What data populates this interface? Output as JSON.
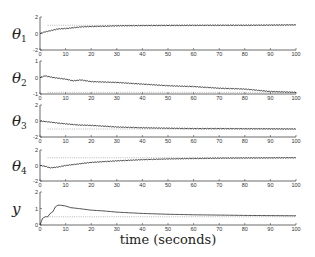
{
  "chart_data": {
    "type": "line",
    "xlabel": "time (seconds)",
    "xlim": [
      0,
      100
    ],
    "xticks": [
      0,
      10,
      20,
      30,
      40,
      50,
      60,
      70,
      80,
      90,
      100
    ],
    "grid": false,
    "legend": null,
    "panels": [
      {
        "ylabel": "θ",
        "ylabel_sub": "1",
        "ylim": [
          -2,
          2
        ],
        "yticks": [
          -2,
          0,
          2
        ],
        "reference": 1,
        "x": [
          0,
          2,
          5,
          7,
          10,
          13,
          16,
          20,
          25,
          30,
          40,
          50,
          60,
          70,
          80,
          90,
          100
        ],
        "y": [
          0,
          0.2,
          0.4,
          0.55,
          0.6,
          0.7,
          0.8,
          0.85,
          0.88,
          0.93,
          0.96,
          0.98,
          0.99,
          1.0,
          1.0,
          1.02,
          1.05
        ]
      },
      {
        "ylabel": "θ",
        "ylabel_sub": "2",
        "ylim": [
          -1,
          1
        ],
        "yticks": [
          -1,
          0,
          1
        ],
        "reference": -0.9,
        "x": [
          0,
          2,
          5,
          10,
          13,
          16,
          20,
          30,
          40,
          50,
          60,
          70,
          80,
          90,
          100
        ],
        "y": [
          0,
          0.1,
          0.0,
          -0.1,
          -0.2,
          -0.15,
          -0.25,
          -0.3,
          -0.4,
          -0.5,
          -0.55,
          -0.65,
          -0.7,
          -0.85,
          -0.9
        ]
      },
      {
        "ylabel": "θ",
        "ylabel_sub": "3",
        "ylim": [
          -2,
          2
        ],
        "yticks": [
          -2,
          0,
          2
        ],
        "reference": -1,
        "x": [
          0,
          3,
          8,
          15,
          20,
          30,
          40,
          50,
          60,
          70,
          80,
          90,
          100
        ],
        "y": [
          0,
          -0.1,
          -0.3,
          -0.5,
          -0.55,
          -0.75,
          -0.85,
          -0.9,
          -0.95,
          -0.95,
          -0.97,
          -0.98,
          -1.0
        ]
      },
      {
        "ylabel": "θ",
        "ylabel_sub": "4",
        "ylim": [
          -2,
          2
        ],
        "yticks": [
          -2,
          0,
          2
        ],
        "reference": 1,
        "x": [
          0,
          2,
          4,
          7,
          10,
          15,
          20,
          30,
          40,
          50,
          60,
          70,
          80,
          90,
          100
        ],
        "y": [
          0,
          -0.1,
          -0.3,
          -0.2,
          0,
          0.2,
          0.4,
          0.6,
          0.75,
          0.85,
          0.9,
          0.95,
          0.97,
          0.98,
          1.0
        ]
      },
      {
        "ylabel": "y",
        "ylabel_sub": "",
        "ylim": [
          0,
          2
        ],
        "yticks": [
          0,
          1,
          2
        ],
        "reference": 0.5,
        "x": [
          0,
          1,
          2,
          3,
          4,
          5,
          6,
          7,
          8,
          10,
          12,
          15,
          20,
          25,
          30,
          40,
          50,
          60,
          70,
          80,
          90,
          100
        ],
        "y": [
          0,
          0.4,
          0.5,
          0.5,
          0.7,
          0.8,
          1.1,
          1.2,
          1.2,
          1.15,
          1.05,
          1.0,
          0.9,
          0.85,
          0.78,
          0.7,
          0.65,
          0.62,
          0.6,
          0.58,
          0.57,
          0.56
        ]
      }
    ]
  }
}
